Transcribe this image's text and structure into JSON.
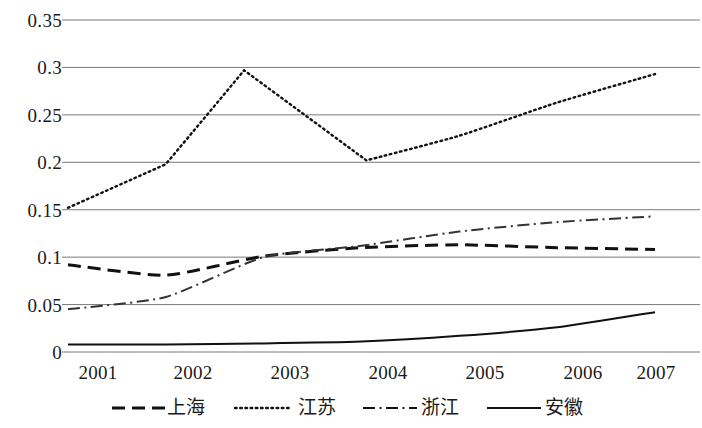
{
  "chart_data": {
    "type": "line",
    "title": "",
    "subtitle": "",
    "xlabel": "",
    "ylabel": "",
    "x": [
      2001,
      2002,
      2003,
      2004,
      2005,
      2006,
      2007
    ],
    "categories": [
      "2001",
      "2002",
      "2003",
      "2004",
      "2005",
      "2006",
      "2007"
    ],
    "xlim": [
      2001,
      2007
    ],
    "ylim": [
      0,
      0.35
    ],
    "yticks": [
      0,
      0.05,
      0.1,
      0.15,
      0.2,
      0.25,
      0.3,
      0.35
    ],
    "ytick_labels": [
      "0",
      "0.05",
      "0.1",
      "0.15",
      "0.2",
      "0.25",
      "0.3",
      "0.35"
    ],
    "xtick_labels": [
      "2001",
      "2002",
      "2003",
      "2004",
      "2005",
      "2006",
      "2007"
    ],
    "grid": "horizontal",
    "legend_position": "bottom",
    "series": [
      {
        "name": "上海",
        "style": "dashed",
        "color": "#111111",
        "values": [
          0.092,
          0.081,
          0.101,
          0.11,
          0.113,
          0.11,
          0.108
        ]
      },
      {
        "name": "江苏",
        "style": "dotted",
        "color": "#111111",
        "values": [
          0.152,
          0.198,
          0.285,
          0.202,
          0.228,
          0.263,
          0.293
        ],
        "peak": {
          "x": 2002.8,
          "y": 0.297
        },
        "trough": {
          "x": 2004.05,
          "y": 0.202
        }
      },
      {
        "name": "浙江",
        "style": "dashdot",
        "color": "#333333",
        "values": [
          0.045,
          0.058,
          0.1,
          0.112,
          0.127,
          0.137,
          0.143
        ]
      },
      {
        "name": "安徽",
        "style": "solid",
        "color": "#111111",
        "values": [
          0.008,
          0.008,
          0.009,
          0.011,
          0.017,
          0.026,
          0.042
        ]
      }
    ]
  },
  "legend": {
    "items": [
      {
        "label": "上海",
        "style": "dashed"
      },
      {
        "label": "江苏",
        "style": "dotted"
      },
      {
        "label": "浙江",
        "style": "dashdot"
      },
      {
        "label": "安徽",
        "style": "solid"
      }
    ]
  },
  "axis": {
    "y_labels": [
      "0.35",
      "0.3",
      "0.25",
      "0.2",
      "0.15",
      "0.1",
      "0.05",
      "0"
    ],
    "x_labels": [
      "2001",
      "2002",
      "2003",
      "2004",
      "2005",
      "2006",
      "2007"
    ]
  },
  "colors": {
    "gridline": "#7a7a7a",
    "line": "#111111",
    "background": "#ffffff",
    "text": "#1a1a1a"
  }
}
